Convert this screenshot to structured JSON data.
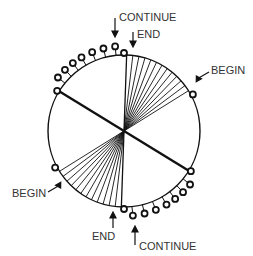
{
  "diagram": {
    "center": [
      124,
      131
    ],
    "radius": 76,
    "stroke_color": "#111111",
    "label_color": "#333333",
    "labels": {
      "top_continue": "CONTINUE",
      "top_end": "END",
      "right_begin": "BEGIN",
      "left_begin": "BEGIN",
      "bottom_end": "END",
      "bottom_continue": "CONTINUE"
    },
    "upper_fan": {
      "start_deg": -88,
      "end_deg": -32,
      "count": 13
    },
    "lower_fan": {
      "start_deg": 92,
      "end_deg": 148,
      "count": 13
    },
    "diameter_deg": -148.5,
    "upper_pins_deg": [
      -149,
      -141,
      -134,
      -127,
      -120,
      -112,
      -104,
      -96,
      -90
    ],
    "lower_pins_deg": [
      31,
      39,
      46,
      53,
      60,
      68,
      76,
      84,
      90
    ],
    "begin_pins_deg": [
      -28,
      152
    ]
  }
}
